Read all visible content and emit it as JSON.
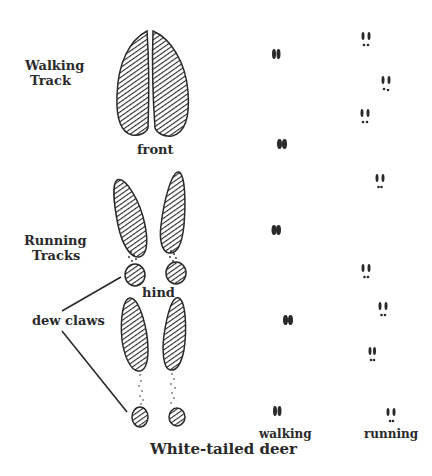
{
  "title": "White-tailed deer",
  "labels": {
    "walking_track": [
      "Walking",
      "Track"
    ],
    "running_tracks": [
      "Running",
      "Tracks"
    ],
    "front": "front",
    "hind": "hind",
    "dew_claws": "dew claws",
    "walking": "walking",
    "running": "running"
  },
  "diagram": {
    "prints": [
      {
        "name": "front-walking-track",
        "type": "two-toed hoof, large"
      },
      {
        "name": "hind-running-track-upper",
        "type": "splayed hoof with dew claws"
      },
      {
        "name": "hind-running-track-lower",
        "type": "splayed hoof with dew claws, widely separated"
      }
    ],
    "trail_patterns": [
      {
        "name": "walking",
        "print_count": 6
      },
      {
        "name": "running",
        "print_count": 8
      }
    ],
    "colors": {
      "ink": "#2a2a2a",
      "background": "#ffffff"
    }
  }
}
